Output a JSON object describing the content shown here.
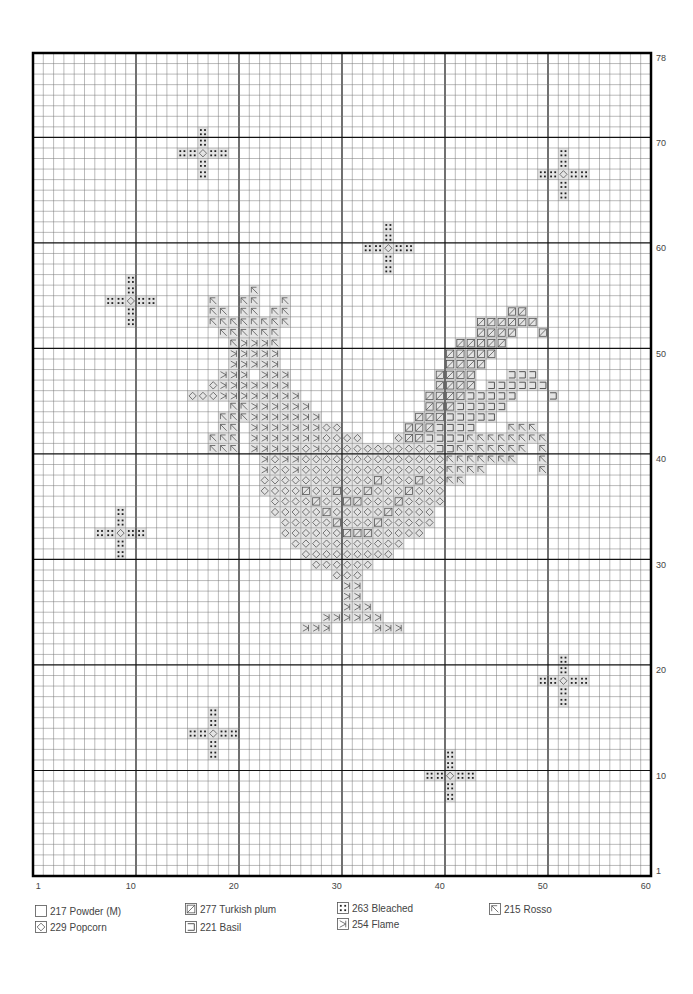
{
  "pattern": {
    "columns": 60,
    "rows": 78,
    "x_axis_labels": [
      {
        "col": 1,
        "text": "1"
      },
      {
        "col": 10,
        "text": "10"
      },
      {
        "col": 20,
        "text": "20"
      },
      {
        "col": 30,
        "text": "30"
      },
      {
        "col": 40,
        "text": "40"
      },
      {
        "col": 50,
        "text": "50"
      },
      {
        "col": 60,
        "text": "60"
      }
    ],
    "y_axis_labels": [
      {
        "row": 78,
        "text": "78"
      },
      {
        "row": 70,
        "text": "70"
      },
      {
        "row": 60,
        "text": "60"
      },
      {
        "row": 50,
        "text": "50"
      },
      {
        "row": 40,
        "text": "40"
      },
      {
        "row": 30,
        "text": "30"
      },
      {
        "row": 20,
        "text": "20"
      },
      {
        "row": 10,
        "text": "10"
      },
      {
        "row": 1,
        "text": "1"
      }
    ],
    "major_grid_every": 10,
    "crosses": [
      {
        "col": 17,
        "row": 69
      },
      {
        "col": 52,
        "row": 67
      },
      {
        "col": 35,
        "row": 60
      },
      {
        "col": 10,
        "row": 55
      },
      {
        "col": 9,
        "row": 33
      },
      {
        "col": 52,
        "row": 19
      },
      {
        "col": 18,
        "row": 14
      },
      {
        "col": 41,
        "row": 10
      }
    ],
    "stitch_rows": [
      {
        "row": 56,
        "runs": [
          [
            "R",
            22,
            22
          ]
        ]
      },
      {
        "row": 55,
        "runs": [
          [
            "R",
            18,
            18
          ],
          [
            "R",
            21,
            22
          ],
          [
            "R",
            25,
            25
          ]
        ]
      },
      {
        "row": 54,
        "runs": [
          [
            "R",
            18,
            19
          ],
          [
            "R",
            21,
            22
          ],
          [
            "R",
            24,
            25
          ],
          [
            "T",
            47,
            48
          ]
        ]
      },
      {
        "row": 53,
        "runs": [
          [
            "R",
            18,
            25
          ],
          [
            "T",
            44,
            49
          ]
        ]
      },
      {
        "row": 52,
        "runs": [
          [
            "R",
            19,
            24
          ],
          [
            "T",
            44,
            47
          ],
          [
            "T",
            50,
            50
          ]
        ]
      },
      {
        "row": 51,
        "runs": [
          [
            "R",
            20,
            20
          ],
          [
            "F",
            21,
            23
          ],
          [
            "R",
            24,
            24
          ],
          [
            "T",
            42,
            46
          ]
        ]
      },
      {
        "row": 50,
        "runs": [
          [
            "F",
            20,
            24
          ],
          [
            "T",
            41,
            45
          ]
        ]
      },
      {
        "row": 49,
        "runs": [
          [
            "F",
            20,
            24
          ],
          [
            "T",
            41,
            44
          ]
        ]
      },
      {
        "row": 48,
        "runs": [
          [
            "F",
            19,
            21
          ],
          [
            "F",
            23,
            25
          ],
          [
            "T",
            40,
            43
          ],
          [
            "L",
            47,
            49
          ]
        ]
      },
      {
        "row": 47,
        "runs": [
          [
            "P",
            18,
            18
          ],
          [
            "F",
            19,
            25
          ],
          [
            "T",
            40,
            43
          ],
          [
            "L",
            45,
            50
          ]
        ]
      },
      {
        "row": 46,
        "runs": [
          [
            "P",
            16,
            18
          ],
          [
            "F",
            19,
            26
          ],
          [
            "T",
            39,
            42
          ],
          [
            "L",
            43,
            47
          ],
          [
            "L",
            51,
            51
          ]
        ]
      },
      {
        "row": 45,
        "runs": [
          [
            "R",
            20,
            21
          ],
          [
            "F",
            22,
            27
          ],
          [
            "T",
            39,
            41
          ],
          [
            "L",
            42,
            46
          ]
        ]
      },
      {
        "row": 44,
        "runs": [
          [
            "R",
            19,
            21
          ],
          [
            "F",
            22,
            28
          ],
          [
            "T",
            38,
            40
          ],
          [
            "L",
            41,
            45
          ]
        ]
      },
      {
        "row": 43,
        "runs": [
          [
            "R",
            19,
            20
          ],
          [
            "F",
            22,
            28
          ],
          [
            "P",
            29,
            30
          ],
          [
            "T",
            37,
            39
          ],
          [
            "L",
            40,
            43
          ],
          [
            "R",
            47,
            49
          ]
        ]
      },
      {
        "row": 42,
        "runs": [
          [
            "R",
            18,
            20
          ],
          [
            "F",
            22,
            28
          ],
          [
            "P",
            29,
            32
          ],
          [
            "P",
            36,
            36
          ],
          [
            "T",
            37,
            38
          ],
          [
            "L",
            39,
            42
          ],
          [
            "R",
            43,
            49
          ],
          [
            "R",
            50,
            50
          ]
        ]
      },
      {
        "row": 41,
        "runs": [
          [
            "R",
            18,
            20
          ],
          [
            "F",
            22,
            26
          ],
          [
            "P",
            27,
            27
          ],
          [
            "F",
            28,
            28
          ],
          [
            "P",
            29,
            39
          ],
          [
            "L",
            40,
            41
          ],
          [
            "R",
            42,
            48
          ],
          [
            "R",
            50,
            50
          ]
        ]
      },
      {
        "row": 40,
        "runs": [
          [
            "F",
            23,
            23
          ],
          [
            "P",
            24,
            24
          ],
          [
            "F",
            25,
            26
          ],
          [
            "P",
            27,
            40
          ],
          [
            "R",
            41,
            47
          ],
          [
            "R",
            50,
            50
          ]
        ]
      },
      {
        "row": 39,
        "runs": [
          [
            "F",
            23,
            23
          ],
          [
            "P",
            24,
            25
          ],
          [
            "F",
            26,
            26
          ],
          [
            "P",
            27,
            40
          ],
          [
            "R",
            41,
            44
          ],
          [
            "R",
            50,
            50
          ]
        ]
      },
      {
        "row": 38,
        "runs": [
          [
            "P",
            23,
            33
          ],
          [
            "T",
            34,
            34
          ],
          [
            "P",
            35,
            37
          ],
          [
            "T",
            38,
            38
          ],
          [
            "P",
            39,
            40
          ],
          [
            "R",
            41,
            42
          ]
        ]
      },
      {
        "row": 37,
        "runs": [
          [
            "P",
            23,
            26
          ],
          [
            "T",
            27,
            27
          ],
          [
            "P",
            28,
            29
          ],
          [
            "T",
            30,
            30
          ],
          [
            "P",
            31,
            32
          ],
          [
            "T",
            33,
            33
          ],
          [
            "P",
            34,
            36
          ],
          [
            "T",
            37,
            37
          ],
          [
            "P",
            38,
            40
          ]
        ]
      },
      {
        "row": 36,
        "runs": [
          [
            "P",
            24,
            27
          ],
          [
            "T",
            28,
            28
          ],
          [
            "P",
            29,
            30
          ],
          [
            "T",
            31,
            32
          ],
          [
            "P",
            33,
            35
          ],
          [
            "T",
            36,
            36
          ],
          [
            "P",
            37,
            40
          ]
        ]
      },
      {
        "row": 35,
        "runs": [
          [
            "P",
            24,
            28
          ],
          [
            "T",
            29,
            29
          ],
          [
            "P",
            30,
            34
          ],
          [
            "T",
            35,
            35
          ],
          [
            "P",
            36,
            39
          ]
        ]
      },
      {
        "row": 34,
        "runs": [
          [
            "P",
            25,
            29
          ],
          [
            "T",
            30,
            30
          ],
          [
            "P",
            31,
            33
          ],
          [
            "T",
            34,
            34
          ],
          [
            "P",
            35,
            39
          ]
        ]
      },
      {
        "row": 33,
        "runs": [
          [
            "P",
            25,
            30
          ],
          [
            "T",
            31,
            33
          ],
          [
            "P",
            34,
            38
          ]
        ]
      },
      {
        "row": 32,
        "runs": [
          [
            "P",
            26,
            36
          ]
        ]
      },
      {
        "row": 31,
        "runs": [
          [
            "P",
            27,
            35
          ]
        ]
      },
      {
        "row": 30,
        "runs": [
          [
            "P",
            28,
            33
          ]
        ]
      },
      {
        "row": 29,
        "runs": [
          [
            "P",
            30,
            32
          ]
        ]
      },
      {
        "row": 28,
        "runs": [
          [
            "F",
            31,
            32
          ]
        ]
      },
      {
        "row": 27,
        "runs": [
          [
            "F",
            31,
            32
          ]
        ]
      },
      {
        "row": 26,
        "runs": [
          [
            "F",
            31,
            33
          ]
        ]
      },
      {
        "row": 25,
        "runs": [
          [
            "F",
            29,
            34
          ]
        ]
      },
      {
        "row": 24,
        "runs": [
          [
            "F",
            27,
            29
          ],
          [
            "F",
            34,
            36
          ]
        ]
      }
    ]
  },
  "legend": [
    {
      "symbol": "blank",
      "code": "217",
      "name": "Powder (M)",
      "label": "217 Powder (M)"
    },
    {
      "symbol": "P",
      "code": "229",
      "name": "Popcorn",
      "label": "229 Popcorn"
    },
    {
      "symbol": "T",
      "code": "277",
      "name": "Turkish plum",
      "label": "277 Turkish plum"
    },
    {
      "symbol": "L",
      "code": "221",
      "name": "Basil",
      "label": "221 Basil"
    },
    {
      "symbol": "B",
      "code": "263",
      "name": "Bleached",
      "label": "263 Bleached"
    },
    {
      "symbol": "F",
      "code": "254",
      "name": "Flame",
      "label": "254 Flame"
    },
    {
      "symbol": "R",
      "code": "215",
      "name": "Rosso",
      "label": "215 Rosso"
    }
  ]
}
